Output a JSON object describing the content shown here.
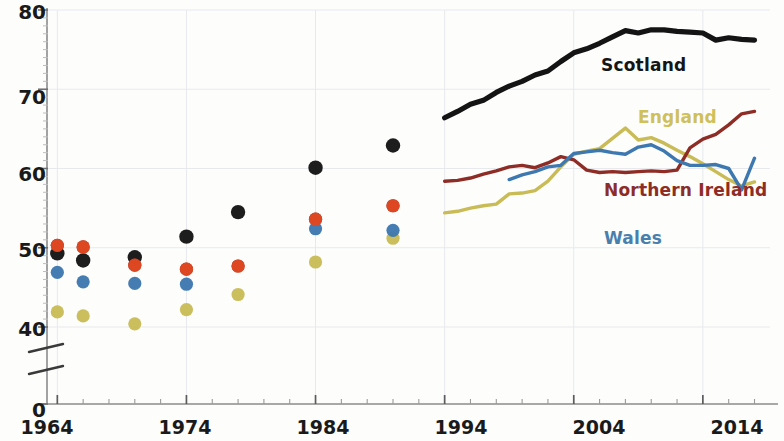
{
  "chart_data": {
    "type": "scatter",
    "title": "",
    "xlabel": "",
    "ylabel": "",
    "xlim": [
      1963,
      2019
    ],
    "ylim": [
      38,
      80
    ],
    "yticks": [
      0,
      40,
      50,
      60,
      70,
      80
    ],
    "ytick_labels": [
      "0",
      "40",
      "50",
      "60",
      "70",
      "80"
    ],
    "xticks": [
      1964,
      1974,
      1984,
      1994,
      2004,
      2014
    ],
    "xtick_labels": [
      "1964",
      "1974",
      "1984",
      "1994",
      "2004",
      "2014"
    ],
    "minor_xtick_interval": 2,
    "axis_break": {
      "between": [
        0,
        40
      ],
      "style": "double-slash"
    },
    "grid": "faint",
    "legend_position": "inline-labels",
    "series": [
      {
        "name": "Scotland",
        "color": "#141414",
        "label_color": "#151515",
        "marker": "circle",
        "scatter": [
          {
            "x": 1964,
            "y": 49.3
          },
          {
            "x": 1966,
            "y": 48.4
          },
          {
            "x": 1970,
            "y": 48.8
          },
          {
            "x": 1974,
            "y": 51.4
          },
          {
            "x": 1978,
            "y": 54.5
          },
          {
            "x": 1984,
            "y": 60.1
          },
          {
            "x": 1990,
            "y": 62.9
          }
        ],
        "line": [
          {
            "x": 1994,
            "y": 66.4
          },
          {
            "x": 1995,
            "y": 67.2
          },
          {
            "x": 1996,
            "y": 68.1
          },
          {
            "x": 1997,
            "y": 68.6
          },
          {
            "x": 1998,
            "y": 69.6
          },
          {
            "x": 1999,
            "y": 70.4
          },
          {
            "x": 2000,
            "y": 71.0
          },
          {
            "x": 2001,
            "y": 71.8
          },
          {
            "x": 2002,
            "y": 72.3
          },
          {
            "x": 2003,
            "y": 73.5
          },
          {
            "x": 2004,
            "y": 74.6
          },
          {
            "x": 2005,
            "y": 75.1
          },
          {
            "x": 2006,
            "y": 75.8
          },
          {
            "x": 2007,
            "y": 76.6
          },
          {
            "x": 2008,
            "y": 77.4
          },
          {
            "x": 2009,
            "y": 77.1
          },
          {
            "x": 2010,
            "y": 77.5
          },
          {
            "x": 2011,
            "y": 77.5
          },
          {
            "x": 2012,
            "y": 77.3
          },
          {
            "x": 2013,
            "y": 77.2
          },
          {
            "x": 2014,
            "y": 77.1
          },
          {
            "x": 2015,
            "y": 76.2
          },
          {
            "x": 2016,
            "y": 76.5
          },
          {
            "x": 2017,
            "y": 76.3
          },
          {
            "x": 2018,
            "y": 76.2
          }
        ]
      },
      {
        "name": "England",
        "color": "#c9bb55",
        "label_color": "#cfc05a",
        "marker": "circle",
        "scatter": [
          {
            "x": 1964,
            "y": 41.9
          },
          {
            "x": 1966,
            "y": 41.4
          },
          {
            "x": 1970,
            "y": 40.4
          },
          {
            "x": 1974,
            "y": 42.2
          },
          {
            "x": 1978,
            "y": 44.1
          },
          {
            "x": 1984,
            "y": 48.2
          },
          {
            "x": 1990,
            "y": 51.2
          }
        ],
        "line": [
          {
            "x": 1994,
            "y": 54.4
          },
          {
            "x": 1995,
            "y": 54.6
          },
          {
            "x": 1996,
            "y": 55.0
          },
          {
            "x": 1997,
            "y": 55.3
          },
          {
            "x": 1998,
            "y": 55.5
          },
          {
            "x": 1999,
            "y": 56.8
          },
          {
            "x": 2000,
            "y": 56.9
          },
          {
            "x": 2001,
            "y": 57.2
          },
          {
            "x": 2002,
            "y": 58.4
          },
          {
            "x": 2003,
            "y": 60.2
          },
          {
            "x": 2004,
            "y": 61.8
          },
          {
            "x": 2005,
            "y": 62.2
          },
          {
            "x": 2006,
            "y": 62.5
          },
          {
            "x": 2007,
            "y": 63.8
          },
          {
            "x": 2008,
            "y": 65.1
          },
          {
            "x": 2009,
            "y": 63.6
          },
          {
            "x": 2010,
            "y": 63.9
          },
          {
            "x": 2011,
            "y": 63.2
          },
          {
            "x": 2012,
            "y": 62.3
          },
          {
            "x": 2013,
            "y": 61.5
          },
          {
            "x": 2014,
            "y": 60.6
          },
          {
            "x": 2015,
            "y": 59.6
          },
          {
            "x": 2016,
            "y": 58.6
          },
          {
            "x": 2017,
            "y": 57.8
          },
          {
            "x": 2018,
            "y": 58.3
          }
        ]
      },
      {
        "name": "Northern Ireland",
        "color": "#8e2c26",
        "label_color": "#8e2c26",
        "marker": "circle",
        "scatter": [
          {
            "x": 1964,
            "y": 50.3
          },
          {
            "x": 1966,
            "y": 50.1
          },
          {
            "x": 1970,
            "y": 47.8
          },
          {
            "x": 1974,
            "y": 47.3
          },
          {
            "x": 1978,
            "y": 47.7
          },
          {
            "x": 1984,
            "y": 53.6
          },
          {
            "x": 1990,
            "y": 55.3
          }
        ],
        "line": [
          {
            "x": 1994,
            "y": 58.4
          },
          {
            "x": 1995,
            "y": 58.5
          },
          {
            "x": 1996,
            "y": 58.8
          },
          {
            "x": 1997,
            "y": 59.3
          },
          {
            "x": 1998,
            "y": 59.7
          },
          {
            "x": 1999,
            "y": 60.2
          },
          {
            "x": 2000,
            "y": 60.4
          },
          {
            "x": 2001,
            "y": 60.1
          },
          {
            "x": 2002,
            "y": 60.7
          },
          {
            "x": 2003,
            "y": 61.5
          },
          {
            "x": 2004,
            "y": 61.1
          },
          {
            "x": 2005,
            "y": 59.8
          },
          {
            "x": 2006,
            "y": 59.5
          },
          {
            "x": 2007,
            "y": 59.6
          },
          {
            "x": 2008,
            "y": 59.5
          },
          {
            "x": 2009,
            "y": 59.6
          },
          {
            "x": 2010,
            "y": 59.7
          },
          {
            "x": 2011,
            "y": 59.6
          },
          {
            "x": 2012,
            "y": 59.8
          },
          {
            "x": 2013,
            "y": 62.6
          },
          {
            "x": 2014,
            "y": 63.7
          },
          {
            "x": 2015,
            "y": 64.3
          },
          {
            "x": 2016,
            "y": 65.5
          },
          {
            "x": 2017,
            "y": 66.9
          },
          {
            "x": 2018,
            "y": 67.2
          }
        ]
      },
      {
        "name": "Wales",
        "color": "#3d78b0",
        "label_color": "#4a7fad",
        "marker": "circle",
        "scatter": [
          {
            "x": 1964,
            "y": 46.9
          },
          {
            "x": 1966,
            "y": 45.7
          },
          {
            "x": 1970,
            "y": 45.5
          },
          {
            "x": 1974,
            "y": 45.4
          },
          {
            "x": 1984,
            "y": 52.4
          },
          {
            "x": 1990,
            "y": 52.2
          }
        ],
        "line": [
          {
            "x": 1999,
            "y": 58.6
          },
          {
            "x": 2000,
            "y": 59.2
          },
          {
            "x": 2001,
            "y": 59.6
          },
          {
            "x": 2002,
            "y": 60.2
          },
          {
            "x": 2003,
            "y": 60.4
          },
          {
            "x": 2004,
            "y": 61.9
          },
          {
            "x": 2005,
            "y": 62.1
          },
          {
            "x": 2006,
            "y": 62.3
          },
          {
            "x": 2007,
            "y": 62.0
          },
          {
            "x": 2008,
            "y": 61.8
          },
          {
            "x": 2009,
            "y": 62.7
          },
          {
            "x": 2010,
            "y": 63.0
          },
          {
            "x": 2011,
            "y": 62.2
          },
          {
            "x": 2012,
            "y": 61.0
          },
          {
            "x": 2013,
            "y": 60.4
          },
          {
            "x": 2014,
            "y": 60.4
          },
          {
            "x": 2015,
            "y": 60.5
          },
          {
            "x": 2016,
            "y": 60.0
          },
          {
            "x": 2017,
            "y": 57.3
          },
          {
            "x": 2018,
            "y": 61.3
          }
        ]
      },
      {
        "name": "Scatter secondary",
        "color": "#e04820",
        "label_color": "#e04820",
        "marker": "circle",
        "scatter": [
          {
            "x": 1964,
            "y": 50.3
          },
          {
            "x": 1966,
            "y": 50.1
          },
          {
            "x": 1970,
            "y": 47.8
          },
          {
            "x": 1974,
            "y": 47.3
          },
          {
            "x": 1978,
            "y": 47.7
          },
          {
            "x": 1984,
            "y": 53.6
          },
          {
            "x": 1990,
            "y": 55.3
          }
        ],
        "line": []
      }
    ],
    "annotations": [
      {
        "text": "Scotland",
        "x": 2003,
        "y": 72.0,
        "color": "#151515"
      },
      {
        "text": "England",
        "x": 2006,
        "y": 64.5,
        "color": "#cfc05a"
      },
      {
        "text": "Northern Ireland",
        "x": 2007,
        "y": 56.0,
        "color": "#8e2c26"
      },
      {
        "text": "Wales",
        "x": 2006,
        "y": 50.5,
        "color": "#4a7fad"
      }
    ]
  },
  "axes": {
    "y_tick_labels": [
      "80",
      "70",
      "60",
      "50",
      "40",
      "0"
    ],
    "x_tick_labels": [
      "1964",
      "1974",
      "1984",
      "1994",
      "2004",
      "2014"
    ]
  },
  "labels": {
    "scotland": "Scotland",
    "england": "England",
    "northern_ireland": "Northern Ireland",
    "wales": "Wales"
  }
}
